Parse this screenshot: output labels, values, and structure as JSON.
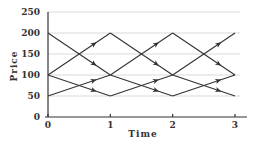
{
  "chart_data": {
    "type": "line",
    "title": "",
    "xlabel": "Time",
    "ylabel": "Price",
    "xlim": [
      0,
      3
    ],
    "ylim": [
      0,
      250
    ],
    "x_ticks": [
      "0",
      "1",
      "2",
      "3"
    ],
    "y_ticks": [
      "0",
      "50",
      "100",
      "150",
      "200",
      "250"
    ],
    "grid": {
      "horizontal": true,
      "vertical": false
    },
    "legend": null,
    "segments": [
      {
        "from": [
          0,
          200
        ],
        "to": [
          1,
          100
        ]
      },
      {
        "from": [
          0,
          100
        ],
        "to": [
          1,
          200
        ]
      },
      {
        "from": [
          0,
          100
        ],
        "to": [
          1,
          50
        ]
      },
      {
        "from": [
          0,
          50
        ],
        "to": [
          1,
          100
        ]
      },
      {
        "from": [
          1,
          200
        ],
        "to": [
          2,
          100
        ]
      },
      {
        "from": [
          1,
          100
        ],
        "to": [
          2,
          200
        ]
      },
      {
        "from": [
          1,
          100
        ],
        "to": [
          2,
          50
        ]
      },
      {
        "from": [
          1,
          50
        ],
        "to": [
          2,
          100
        ]
      },
      {
        "from": [
          2,
          200
        ],
        "to": [
          3,
          100
        ]
      },
      {
        "from": [
          2,
          100
        ],
        "to": [
          3,
          200
        ]
      },
      {
        "from": [
          2,
          100
        ],
        "to": [
          3,
          50
        ]
      },
      {
        "from": [
          2,
          50
        ],
        "to": [
          3,
          100
        ]
      }
    ]
  },
  "colors": {
    "line": "#333333",
    "grid": "#cfcfcf",
    "axis": "#333333"
  }
}
